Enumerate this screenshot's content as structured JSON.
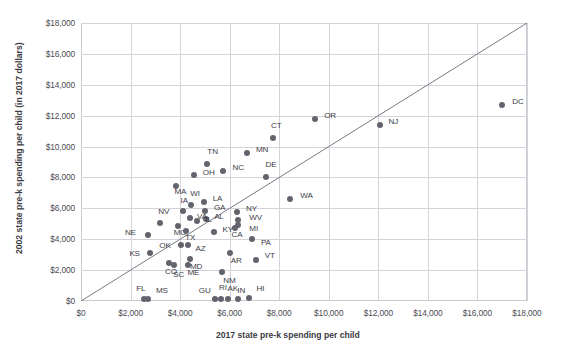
{
  "chart_data": {
    "type": "scatter",
    "title": "",
    "xlabel": "2017 state pre-k spending per child",
    "ylabel": "2002 state pre-k spending per child (in 2017 dollars)",
    "xlim": [
      0,
      18000
    ],
    "ylim": [
      0,
      18000
    ],
    "xticks": [
      "$0",
      "$2,000",
      "$4,000",
      "$6,000",
      "$8,000",
      "$10,000",
      "$12,000",
      "$14,000",
      "$16,000",
      "$18,000"
    ],
    "xtick_values": [
      0,
      2000,
      4000,
      6000,
      8000,
      10000,
      12000,
      14000,
      16000,
      18000
    ],
    "yticks": [
      "$0",
      "$2,000",
      "$4,000",
      "$6,000",
      "$8,000",
      "$10,000",
      "$12,000",
      "$14,000",
      "$16,000",
      "$18,000"
    ],
    "ytick_values": [
      0,
      2000,
      4000,
      6000,
      8000,
      10000,
      12000,
      14000,
      16000,
      18000
    ],
    "grid": true,
    "legend": "none",
    "marker_color": "#63636e",
    "grid_color": "#d3d3d9",
    "reference_line": {
      "name": "y = x parity line",
      "from": [
        0,
        0
      ],
      "to": [
        18000,
        18000
      ]
    },
    "points": [
      {
        "label": "DC",
        "x": 17000,
        "y": 12700,
        "lx": 10,
        "ly": -4
      },
      {
        "label": "NJ",
        "x": 12050,
        "y": 11400,
        "lx": 9,
        "ly": -4
      },
      {
        "label": "OR",
        "x": 9450,
        "y": 11800,
        "lx": 9,
        "ly": -4
      },
      {
        "label": "CT",
        "x": 7750,
        "y": 10550,
        "lx": -2,
        "ly": -13
      },
      {
        "label": "MN",
        "x": 6700,
        "y": 9600,
        "lx": 9,
        "ly": -4
      },
      {
        "label": "TN",
        "x": 5100,
        "y": 8900,
        "lx": 0,
        "ly": -13
      },
      {
        "label": "NC",
        "x": 5750,
        "y": 8400,
        "lx": 9,
        "ly": -4
      },
      {
        "label": "DE",
        "x": 7450,
        "y": 8000,
        "lx": 0,
        "ly": -13
      },
      {
        "label": "OH",
        "x": 4550,
        "y": 8150,
        "lx": 9,
        "ly": -3
      },
      {
        "label": "MA",
        "x": 3850,
        "y": 7450,
        "lx": -2,
        "ly": 5
      },
      {
        "label": "WA",
        "x": 8450,
        "y": 6600,
        "lx": 10,
        "ly": -4
      },
      {
        "label": "LA",
        "x": 4950,
        "y": 6400,
        "lx": 9,
        "ly": -4
      },
      {
        "label": "WI",
        "x": 4450,
        "y": 6200,
        "lx": -1,
        "ly": -12
      },
      {
        "label": "GA",
        "x": 5000,
        "y": 5800,
        "lx": 9,
        "ly": -4
      },
      {
        "label": "IA",
        "x": 4100,
        "y": 5800,
        "lx": -2,
        "ly": -11
      },
      {
        "label": "AL",
        "x": 5050,
        "y": 5300,
        "lx": 8,
        "ly": -3
      },
      {
        "label": "VA",
        "x": 4400,
        "y": 5350,
        "lx": 7,
        "ly": -2
      },
      {
        "label": "IL",
        "x": 4700,
        "y": 5150,
        "lx": 8,
        "ly": -2
      },
      {
        "label": "NY",
        "x": 6300,
        "y": 5750,
        "lx": 9,
        "ly": -4
      },
      {
        "label": "WV",
        "x": 6350,
        "y": 5250,
        "lx": 11,
        "ly": -3
      },
      {
        "label": "MI",
        "x": 6350,
        "y": 4900,
        "lx": 11,
        "ly": 3
      },
      {
        "label": "CA",
        "x": 6200,
        "y": 4700,
        "lx": -3,
        "ly": 6
      },
      {
        "label": "NV",
        "x": 3200,
        "y": 5050,
        "lx": -2,
        "ly": -12
      },
      {
        "label": "MO",
        "x": 3900,
        "y": 4850,
        "lx": -4,
        "ly": 6
      },
      {
        "label": "TX",
        "x": 4250,
        "y": 4550,
        "lx": -1,
        "ly": 6
      },
      {
        "label": "KY",
        "x": 5350,
        "y": 4500,
        "lx": 9,
        "ly": -3
      },
      {
        "label": "NE",
        "x": 2700,
        "y": 4300,
        "lx": -23,
        "ly": -3
      },
      {
        "label": "PA",
        "x": 6900,
        "y": 4000,
        "lx": 9,
        "ly": 3
      },
      {
        "label": "OK",
        "x": 4050,
        "y": 3650,
        "lx": -22,
        "ly": 0
      },
      {
        "label": "AZ",
        "x": 4300,
        "y": 3600,
        "lx": 8,
        "ly": 3
      },
      {
        "label": "KS",
        "x": 2800,
        "y": 3100,
        "lx": -21,
        "ly": 0
      },
      {
        "label": "AR",
        "x": 6000,
        "y": 3100,
        "lx": 1,
        "ly": 7
      },
      {
        "label": "VT",
        "x": 7050,
        "y": 2650,
        "lx": 9,
        "ly": -5
      },
      {
        "label": "MD",
        "x": 4400,
        "y": 2700,
        "lx": 0,
        "ly": 7
      },
      {
        "label": "ME",
        "x": 4300,
        "y": 2350,
        "lx": 0,
        "ly": 7
      },
      {
        "label": "CO",
        "x": 3550,
        "y": 2450,
        "lx": -4,
        "ly": 8
      },
      {
        "label": "SC",
        "x": 3750,
        "y": 2300,
        "lx": -1,
        "ly": 9
      },
      {
        "label": "NM",
        "x": 5700,
        "y": 1900,
        "lx": 1,
        "ly": 8
      },
      {
        "label": "FL",
        "x": 2550,
        "y": 150,
        "lx": -8,
        "ly": -11
      },
      {
        "label": "MS",
        "x": 2700,
        "y": 150,
        "lx": 8,
        "ly": -9
      },
      {
        "label": "GU",
        "x": 5400,
        "y": 150,
        "lx": -16,
        "ly": -9
      },
      {
        "label": "RI",
        "x": 5650,
        "y": 150,
        "lx": -2,
        "ly": -12
      },
      {
        "label": "AK",
        "x": 5950,
        "y": 150,
        "lx": -1,
        "ly": -11
      },
      {
        "label": "IN",
        "x": 6350,
        "y": 100,
        "lx": -1,
        "ly": -9
      },
      {
        "label": "HI",
        "x": 6800,
        "y": 180,
        "lx": 7,
        "ly": -10
      }
    ]
  },
  "plot_geometry": {
    "left": 81,
    "top": 23,
    "right": 527,
    "bottom": 301
  }
}
